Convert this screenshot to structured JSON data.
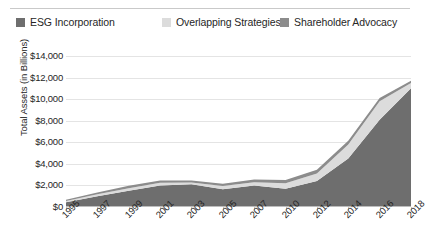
{
  "legend": {
    "position": "top",
    "items": [
      {
        "label": "ESG Incorporation",
        "color": "#6e6e6e",
        "marker": "square-swatch"
      },
      {
        "label": "Overlapping Strategies",
        "color": "#dcdcdc",
        "marker": "square-swatch"
      },
      {
        "label": "Shareholder Advocacy",
        "color": "#8c8c8c",
        "marker": "square-swatch"
      }
    ]
  },
  "axes": {
    "y_title": "Total Assets (in Billions)",
    "y_ticks": [
      "$14,000",
      "$12,000",
      "$10,000",
      "$8,000",
      "$6,000",
      "$4,000",
      "$2,000",
      "$0"
    ],
    "x_ticks": [
      "1995",
      "1997",
      "1999",
      "2001",
      "2003",
      "2005",
      "2007",
      "2010",
      "2012",
      "2014",
      "2016",
      "2018"
    ]
  },
  "chart_data": {
    "type": "area",
    "stacked": true,
    "title": "",
    "xlabel": "",
    "ylabel": "Total Assets (in Billions)",
    "ylim": [
      0,
      14000
    ],
    "ytick_step": 2000,
    "grid": true,
    "legend_position": "top",
    "categories": [
      "1995",
      "1997",
      "1999",
      "2001",
      "2003",
      "2005",
      "2007",
      "2010",
      "2012",
      "2014",
      "2016",
      "2018"
    ],
    "series": [
      {
        "name": "ESG Incorporation",
        "color": "#6e6e6e",
        "values": [
          450,
          1000,
          1500,
          2000,
          2100,
          1650,
          2000,
          1700,
          2400,
          4500,
          8100,
          11000
        ]
      },
      {
        "name": "Overlapping Strategies",
        "color": "#dcdcdc",
        "values": [
          100,
          180,
          250,
          250,
          170,
          300,
          300,
          500,
          700,
          1300,
          1700,
          500
        ]
      },
      {
        "name": "Shareholder Advocacy",
        "color": "#8c8c8c",
        "values": [
          120,
          170,
          220,
          200,
          180,
          200,
          250,
          300,
          350,
          350,
          300,
          200
        ]
      }
    ],
    "totals": [
      670,
      1350,
      1970,
      2450,
      2450,
      2150,
      2550,
      2500,
      3450,
      6150,
      10100,
      11700
    ]
  }
}
